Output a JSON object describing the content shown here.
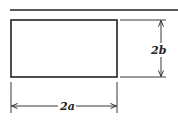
{
  "diagram": {
    "type": "dimensioned-rectangle",
    "width_label": "2a",
    "height_label": "2b",
    "colors": {
      "stroke": "#222222",
      "background": "#ffffff"
    }
  }
}
